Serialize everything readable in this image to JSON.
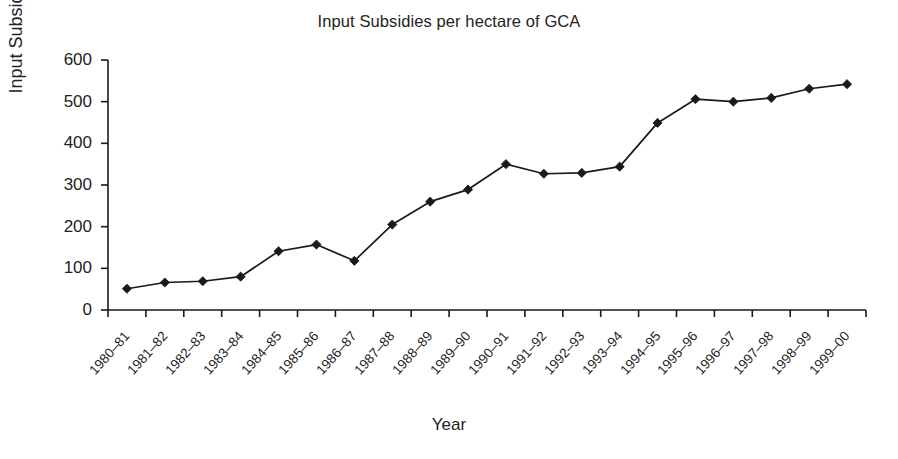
{
  "chart_data": {
    "type": "line",
    "title": "Input Subsidies per hectare of GCA",
    "xlabel": "Year",
    "ylabel": "Input Subsidies",
    "ylim": [
      0,
      600
    ],
    "yticks": [
      0,
      100,
      200,
      300,
      400,
      500,
      600
    ],
    "grid": false,
    "legend": null,
    "marker": "diamond",
    "line_color": "#1a1a1a",
    "marker_color": "#1a1a1a",
    "categories": [
      "1980–81",
      "1981–82",
      "1982–83",
      "1983–84",
      "1984–85",
      "1985–86",
      "1986–87",
      "1987–88",
      "1988–89",
      "1989–90",
      "1990–91",
      "1991–92",
      "1992–93",
      "1993–94",
      "1994–95",
      "1995–96",
      "1996–97",
      "1997–98",
      "1998–99",
      "1999–00"
    ],
    "values": [
      51,
      66,
      69,
      80,
      141,
      157,
      118,
      205,
      260,
      289,
      350,
      327,
      329,
      344,
      449,
      506,
      500,
      509,
      531,
      542
    ]
  }
}
